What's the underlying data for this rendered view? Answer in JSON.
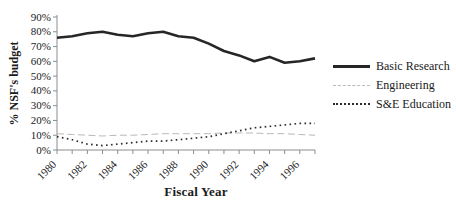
{
  "chart_data": {
    "type": "line",
    "title": "",
    "xlabel": "Fiscal Year",
    "ylabel": "% NSF's budget",
    "x": [
      1980,
      1981,
      1982,
      1983,
      1984,
      1985,
      1986,
      1987,
      1988,
      1989,
      1990,
      1991,
      1992,
      1993,
      1994,
      1995,
      1996,
      1997
    ],
    "x_tick_labels": [
      "1980",
      "1982",
      "1984",
      "1986",
      "1988",
      "1990",
      "1992",
      "1994",
      "1996"
    ],
    "y_tick_labels": [
      "0%",
      "10%",
      "20%",
      "30%",
      "40%",
      "50%",
      "60%",
      "70%",
      "80%",
      "90%"
    ],
    "ylim": [
      0,
      90
    ],
    "grid": false,
    "legend_position": "right",
    "axis_color": "#8c8c8c",
    "text_color": "#1a1a1a",
    "background_color": "#ffffff",
    "series": [
      {
        "name": "Basic Research",
        "style": "solid",
        "color": "#262626",
        "width": 2.6,
        "values": [
          76,
          77,
          79,
          80,
          78,
          77,
          79,
          80,
          77,
          76,
          72,
          67,
          64,
          60,
          63,
          59,
          60,
          62
        ]
      },
      {
        "name": "Engineering",
        "style": "dashed",
        "color": "#b9b9b9",
        "width": 1,
        "values": [
          11,
          10.5,
          10,
          9.5,
          10,
          10,
          10.5,
          11,
          11,
          11,
          11,
          11.5,
          11.5,
          11.5,
          11,
          11,
          10.5,
          10
        ]
      },
      {
        "name": "S&E Education",
        "style": "dotted",
        "color": "#2b2b2b",
        "width": 1.7,
        "values": [
          9,
          7,
          4,
          3,
          4,
          5,
          6,
          6,
          7,
          8,
          9,
          11,
          13,
          15,
          16,
          17,
          18,
          18
        ]
      }
    ]
  }
}
